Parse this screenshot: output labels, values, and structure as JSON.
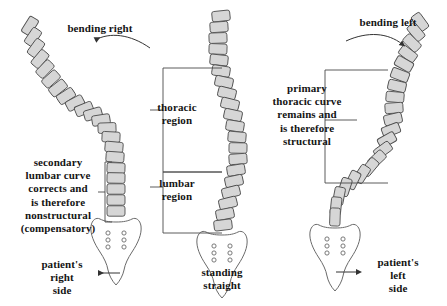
{
  "figure": {
    "width": 447,
    "height": 306,
    "background_color": "#ffffff",
    "ink_color": "#1a1a1a",
    "vertebra_fill": "#d4d4d4",
    "vertebra_stroke": "#555555",
    "bone_stroke": "#666666"
  },
  "panels": {
    "left": {
      "name": "bending-right",
      "top_label": "bending right",
      "bracket_label": "secondary\nlumbar curve\ncorrects and\nis therefore\nnonstructural\n(compensatory)",
      "bottom_label": "patient's\nright\nside",
      "arrow_direction": "left"
    },
    "middle": {
      "name": "standing-straight",
      "bracket_upper_label": "thoracic\nregion",
      "bracket_lower_label": "lumbar\nregion",
      "bottom_label": "standing\nstraight"
    },
    "right": {
      "name": "bending-left",
      "top_label": "bending left",
      "bracket_label": "primary\nthoracic curve\nremains and\nis therefore\nstructural",
      "bottom_label": "patient's\nleft\nside",
      "arrow_direction": "right"
    }
  },
  "icons": {
    "curved_arrow_left": "curved-arrow-left-icon",
    "curved_arrow_right": "curved-arrow-right-icon",
    "straight_arrow_left": "arrow-left-icon",
    "straight_arrow_right": "arrow-right-icon",
    "sacrum": "sacrum-icon",
    "vertebra": "vertebra-icon",
    "bracket": "bracket-icon"
  }
}
